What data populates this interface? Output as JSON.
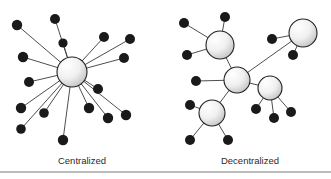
{
  "figure": {
    "background_color": "#ffffff",
    "edge_color": "#3a3a3a",
    "leaf_color": "#1a1a1a",
    "hub_fill_light": "#ffffff",
    "hub_fill_dark": "#c8c8c8",
    "hub_stroke": "#222222",
    "rule_color": "#7a7a7a",
    "panels": [
      {
        "id": "centralized",
        "caption": "Centralized",
        "caption_x": 82,
        "caption_y": 164,
        "hubs": [
          {
            "name": "central-hub",
            "cx": 72,
            "cy": 72,
            "r": 15
          }
        ],
        "leaves": [
          {
            "name": "leaf-n",
            "cx": 55,
            "cy": 19,
            "r": 5.0
          },
          {
            "name": "leaf-nnw",
            "cx": 17,
            "cy": 25,
            "r": 5.2
          },
          {
            "name": "leaf-nw",
            "cx": 63,
            "cy": 43,
            "r": 4.6
          },
          {
            "name": "leaf-wnw",
            "cx": 23,
            "cy": 57,
            "r": 5.2
          },
          {
            "name": "leaf-w",
            "cx": 29,
            "cy": 82,
            "r": 5.0
          },
          {
            "name": "leaf-wsw",
            "cx": 21,
            "cy": 108,
            "r": 5.2
          },
          {
            "name": "leaf-sw",
            "cx": 44,
            "cy": 113,
            "r": 4.8
          },
          {
            "name": "leaf-ssw",
            "cx": 21,
            "cy": 129,
            "r": 4.8
          },
          {
            "name": "leaf-s",
            "cx": 63,
            "cy": 140,
            "r": 5.2
          },
          {
            "name": "leaf-sse",
            "cx": 89,
            "cy": 108,
            "r": 5.2
          },
          {
            "name": "leaf-se",
            "cx": 108,
            "cy": 118,
            "r": 5.2
          },
          {
            "name": "leaf-ese",
            "cx": 126,
            "cy": 115,
            "r": 5.2
          },
          {
            "name": "leaf-e",
            "cx": 98,
            "cy": 89,
            "r": 5.0
          },
          {
            "name": "leaf-ene",
            "cx": 124,
            "cy": 58,
            "r": 5.0
          },
          {
            "name": "leaf-ne",
            "cx": 130,
            "cy": 39,
            "r": 5.0
          },
          {
            "name": "leaf-nne",
            "cx": 104,
            "cy": 37,
            "r": 5.0
          }
        ],
        "edges": [
          {
            "x1": 72,
            "y1": 72,
            "x2": 55,
            "y2": 19
          },
          {
            "x1": 72,
            "y1": 72,
            "x2": 17,
            "y2": 25
          },
          {
            "x1": 72,
            "y1": 72,
            "x2": 63,
            "y2": 43
          },
          {
            "x1": 72,
            "y1": 72,
            "x2": 23,
            "y2": 57
          },
          {
            "x1": 72,
            "y1": 72,
            "x2": 29,
            "y2": 82
          },
          {
            "x1": 72,
            "y1": 72,
            "x2": 21,
            "y2": 108
          },
          {
            "x1": 72,
            "y1": 72,
            "x2": 44,
            "y2": 113
          },
          {
            "x1": 72,
            "y1": 72,
            "x2": 21,
            "y2": 129
          },
          {
            "x1": 72,
            "y1": 72,
            "x2": 63,
            "y2": 140
          },
          {
            "x1": 72,
            "y1": 72,
            "x2": 89,
            "y2": 108
          },
          {
            "x1": 72,
            "y1": 72,
            "x2": 108,
            "y2": 118
          },
          {
            "x1": 72,
            "y1": 72,
            "x2": 126,
            "y2": 115
          },
          {
            "x1": 72,
            "y1": 72,
            "x2": 98,
            "y2": 89
          },
          {
            "x1": 72,
            "y1": 72,
            "x2": 124,
            "y2": 58
          },
          {
            "x1": 72,
            "y1": 72,
            "x2": 130,
            "y2": 39
          },
          {
            "x1": 72,
            "y1": 72,
            "x2": 104,
            "y2": 37
          }
        ]
      },
      {
        "id": "decentralized",
        "caption": "Decentralized",
        "caption_x": 250,
        "caption_y": 164,
        "hubs": [
          {
            "name": "hub-top-left",
            "cx": 220,
            "cy": 45,
            "r": 14
          },
          {
            "name": "hub-top-right",
            "cx": 303,
            "cy": 33,
            "r": 14
          },
          {
            "name": "hub-center",
            "cx": 237,
            "cy": 80,
            "r": 13
          },
          {
            "name": "hub-right",
            "cx": 270,
            "cy": 88,
            "r": 12
          },
          {
            "name": "hub-bottom-left",
            "cx": 212,
            "cy": 113,
            "r": 13
          }
        ],
        "leaves": [
          {
            "name": "leaf-tl-west",
            "cx": 184,
            "cy": 23,
            "r": 5.0
          },
          {
            "name": "leaf-tl-north",
            "cx": 225,
            "cy": 17,
            "r": 5.0
          },
          {
            "name": "leaf-tl-southwest",
            "cx": 187,
            "cy": 55,
            "r": 5.0
          },
          {
            "name": "leaf-tr-west",
            "cx": 272,
            "cy": 39,
            "r": 5.0
          },
          {
            "name": "leaf-tr-south",
            "cx": 293,
            "cy": 55,
            "r": 5.0
          },
          {
            "name": "leaf-center-west",
            "cx": 196,
            "cy": 81,
            "r": 5.0
          },
          {
            "name": "leaf-r-southwest",
            "cx": 256,
            "cy": 109,
            "r": 5.0
          },
          {
            "name": "leaf-r-south",
            "cx": 274,
            "cy": 118,
            "r": 5.0
          },
          {
            "name": "leaf-r-southeast",
            "cx": 291,
            "cy": 112,
            "r": 5.0
          },
          {
            "name": "leaf-bl-west",
            "cx": 190,
            "cy": 105,
            "r": 5.0
          },
          {
            "name": "leaf-bl-southwest",
            "cx": 190,
            "cy": 140,
            "r": 5.0
          },
          {
            "name": "leaf-bl-southeast",
            "cx": 228,
            "cy": 140,
            "r": 5.0
          }
        ],
        "edges": [
          {
            "x1": 237,
            "y1": 80,
            "x2": 220,
            "y2": 45
          },
          {
            "x1": 237,
            "y1": 80,
            "x2": 303,
            "y2": 33
          },
          {
            "x1": 237,
            "y1": 80,
            "x2": 270,
            "y2": 88
          },
          {
            "x1": 237,
            "y1": 80,
            "x2": 212,
            "y2": 113
          },
          {
            "x1": 237,
            "y1": 80,
            "x2": 196,
            "y2": 81
          },
          {
            "x1": 220,
            "y1": 45,
            "x2": 184,
            "y2": 23
          },
          {
            "x1": 220,
            "y1": 45,
            "x2": 225,
            "y2": 17
          },
          {
            "x1": 220,
            "y1": 45,
            "x2": 187,
            "y2": 55
          },
          {
            "x1": 303,
            "y1": 33,
            "x2": 272,
            "y2": 39
          },
          {
            "x1": 303,
            "y1": 33,
            "x2": 293,
            "y2": 55
          },
          {
            "x1": 270,
            "y1": 88,
            "x2": 256,
            "y2": 109
          },
          {
            "x1": 270,
            "y1": 88,
            "x2": 274,
            "y2": 118
          },
          {
            "x1": 270,
            "y1": 88,
            "x2": 291,
            "y2": 112
          },
          {
            "x1": 212,
            "y1": 113,
            "x2": 190,
            "y2": 105
          },
          {
            "x1": 212,
            "y1": 113,
            "x2": 190,
            "y2": 140
          },
          {
            "x1": 212,
            "y1": 113,
            "x2": 228,
            "y2": 140
          }
        ]
      }
    ],
    "rule": {
      "x1": 0,
      "y1": 172,
      "x2": 331,
      "y2": 172
    }
  }
}
